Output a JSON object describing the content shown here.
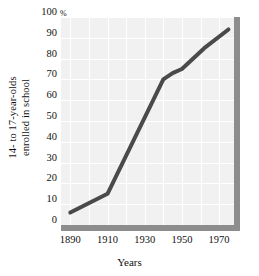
{
  "chart_data": {
    "type": "line",
    "title": "",
    "xlabel": "Years",
    "ylabel": "14- to 17-year-olds enrolled in school",
    "ylabel_lines": [
      "14- to 17-year-olds",
      "enrolled in school"
    ],
    "y_unit_symbol": "%",
    "xlim": [
      1885,
      1978
    ],
    "ylim": [
      0,
      100
    ],
    "xticks": [
      1890,
      1910,
      1930,
      1950,
      1970
    ],
    "xtick_labels": [
      "1890",
      "1910",
      "1930",
      "1950",
      "1970"
    ],
    "yticks": [
      0,
      10,
      20,
      30,
      40,
      50,
      60,
      70,
      80,
      90,
      100
    ],
    "ytick_labels": [
      "0",
      "10",
      "20",
      "30",
      "40",
      "50",
      "60",
      "70",
      "80",
      "90",
      "100"
    ],
    "grid": true,
    "grid_color": "#ffffff",
    "panel_color": "#f1f1f1",
    "line_color": "#4a4a4a",
    "legend": "none",
    "series": [
      {
        "name": "14- to 17-year-olds enrolled in school",
        "x": [
          1890,
          1910,
          1940,
          1945,
          1950,
          1962,
          1975
        ],
        "values": [
          6,
          15,
          70,
          73,
          75,
          85,
          94
        ]
      }
    ]
  },
  "axes": {
    "x_title": "Years",
    "y_title_line1": "14- to 17-year-olds",
    "y_title_line2": "enrolled in school",
    "percent_symbol": "%"
  }
}
